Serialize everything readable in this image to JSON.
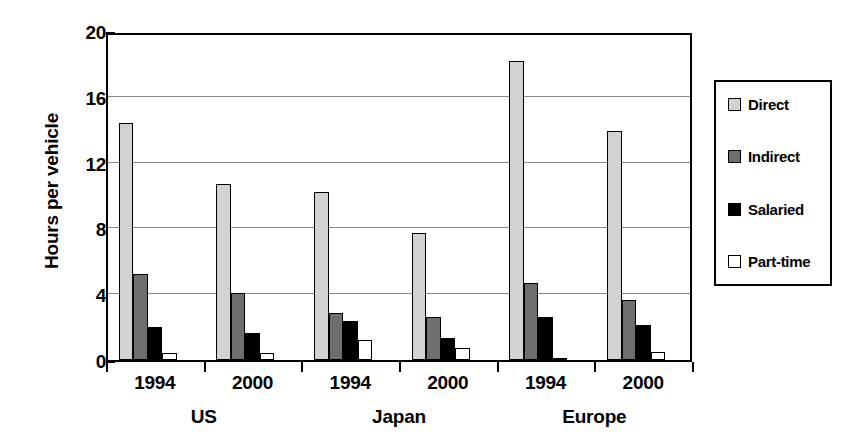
{
  "chart_data": {
    "type": "bar",
    "title": "",
    "xlabel": "",
    "ylabel": "Hours per vehicle",
    "ylim": [
      0,
      20
    ],
    "yticks": [
      0,
      4,
      8,
      12,
      16,
      20
    ],
    "ytick_labels": [
      "0",
      "4",
      "8",
      "12",
      "16",
      "20"
    ],
    "grid": true,
    "legend_position": "right",
    "categories": [
      "1994",
      "2000",
      "1994",
      "2000",
      "1994",
      "2000"
    ],
    "group_labels": [
      "US",
      "Japan",
      "Europe"
    ],
    "series": [
      {
        "name": "Direct",
        "color": "#d2d2d2",
        "values": [
          14.4,
          10.7,
          10.2,
          7.7,
          18.2,
          13.9
        ]
      },
      {
        "name": "Indirect",
        "color": "#6e6e6e",
        "values": [
          5.2,
          4.05,
          2.85,
          2.6,
          4.7,
          3.65
        ]
      },
      {
        "name": "Salaried",
        "color": "#000000",
        "values": [
          2.0,
          1.65,
          2.4,
          1.35,
          2.6,
          2.15
        ]
      },
      {
        "name": "Part-time",
        "color": "#ffffff",
        "values": [
          0.45,
          0.45,
          1.2,
          0.75,
          0.15,
          0.5
        ]
      }
    ]
  },
  "axis": {
    "y_title": "Hours per vehicle"
  },
  "legend": {
    "items": [
      {
        "label": "Direct",
        "swatch": "legend-swatch-direct"
      },
      {
        "label": "Indirect",
        "swatch": "legend-swatch-indirect"
      },
      {
        "label": "Salaried",
        "swatch": "legend-swatch-salaried"
      },
      {
        "label": "Part-time",
        "swatch": "legend-swatch-parttime"
      }
    ]
  }
}
